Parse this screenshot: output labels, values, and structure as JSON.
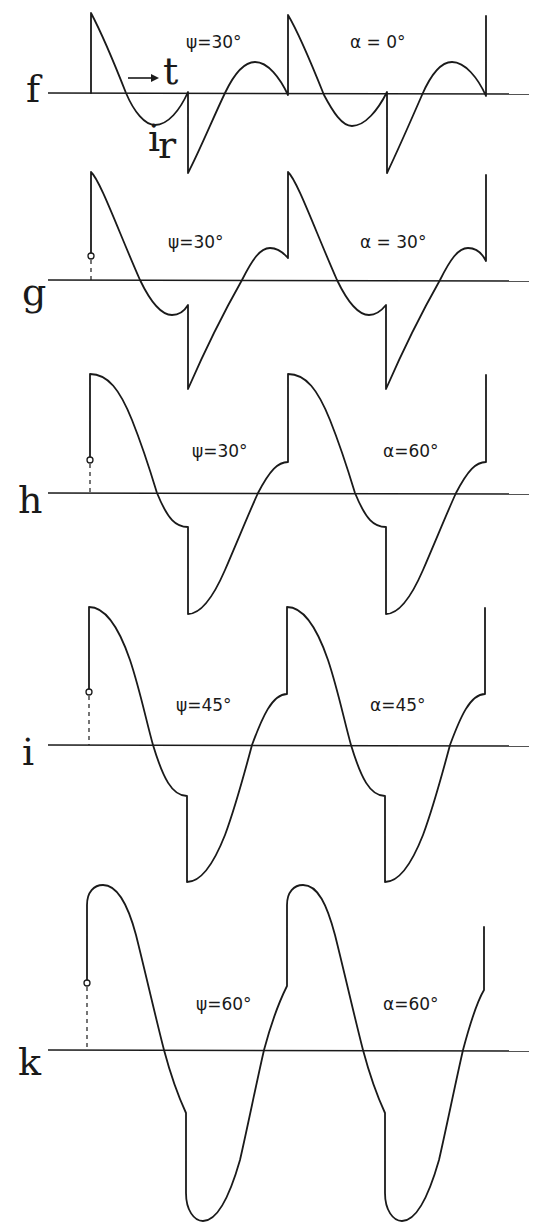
{
  "figure": {
    "ink_color": "#1a1a1a",
    "background": "#ffffff",
    "time_label": "t",
    "current_label": "i",
    "current_subscript": "r",
    "panels": [
      {
        "id": "f",
        "letter": "f",
        "psi_label": "ψ=30°",
        "alpha_label": "α = 0°",
        "axis_y": 93,
        "letter_pos": [
          26,
          102
        ],
        "psi_pos": [
          186,
          48
        ],
        "alpha_pos": [
          350,
          48
        ],
        "has_marker": false,
        "path": "M91 93 L91 13 C100 30 115 65 126 93 C134 112 145 125 155 125 C168 125 180 110 188 92 L188 173 C200 150 213 118 225 93 C235 72 245 62 255 62 C268 62 280 78 288 95 L288 15 C297 30 312 65 324 95 C333 112 342 126 352 126 C365 126 378 110 387 92 L387 173 C398 150 412 118 422 95 C432 72 442 62 452 62 C465 62 478 78 486 96 L486 16"
      },
      {
        "id": "g",
        "letter": "g",
        "psi_label": "ψ=30°",
        "alpha_label": "α = 30°",
        "axis_y": 280,
        "letter_pos": [
          22,
          305
        ],
        "psi_pos": [
          168,
          248
        ],
        "alpha_pos": [
          360,
          248
        ],
        "has_marker": true,
        "marker_y": 256,
        "path": "M91 256 L91 172 C100 180 118 230 140 280 C152 305 162 315 172 315 C180 315 185 310 188 305 L188 389 C205 350 225 310 242 280 C252 260 260 248 270 248 C280 248 285 255 288 258 L288 172 C297 180 315 230 337 280 C349 305 359 315 369 315 C377 315 382 310 386 305 L386 389 C403 350 423 310 440 280 C450 260 458 248 468 248 C478 248 483 255 486 261 L486 175"
      },
      {
        "id": "h",
        "letter": "h",
        "psi_label": "ψ=30°",
        "alpha_label": "α=60°",
        "axis_y": 493,
        "letter_pos": [
          18,
          513
        ],
        "psi_pos": [
          192,
          457
        ],
        "alpha_pos": [
          383,
          457
        ],
        "has_marker": true,
        "marker_y": 460,
        "path": "M90 460 L90 374 C108 374 120 390 132 420 C142 445 150 470 157 493 C168 520 176 527 188 527 L188 614 C200 614 212 600 225 570 C238 540 248 515 258 493 C270 470 278 462 288 462 L288 374 C306 374 318 390 330 420 C340 445 348 470 355 493 C366 520 374 527 386 527 L386 614 C398 614 410 600 423 570 C436 540 446 515 456 493 C468 470 476 462 486 462 L486 375"
      },
      {
        "id": "i",
        "letter": "i",
        "psi_label": "ψ=45°",
        "alpha_label": "α=45°",
        "axis_y": 745,
        "letter_pos": [
          22,
          765
        ],
        "psi_pos": [
          176,
          711
        ],
        "alpha_pos": [
          370,
          711
        ],
        "has_marker": true,
        "marker_y": 692,
        "path": "M89 692 L89 607 C105 607 118 625 130 660 C140 690 146 720 153 745 C163 778 172 796 187 796 L187 882 C200 882 212 868 225 835 C235 808 244 775 252 745 C262 718 272 694 287 694 L287 607 C303 607 316 625 328 660 C338 690 344 720 351 745 C361 778 370 796 385 796 L385 882 C398 882 410 868 423 835 C433 808 442 775 450 745 C460 718 470 694 485 694 L485 608"
      },
      {
        "id": "k",
        "letter": "k",
        "psi_label": "ψ=60°",
        "alpha_label": "α=60°",
        "axis_y": 1050,
        "letter_pos": [
          18,
          1075
        ],
        "psi_pos": [
          196,
          1010
        ],
        "alpha_pos": [
          383,
          1010
        ],
        "has_marker": true,
        "marker_y": 983,
        "path": "M87 983 L87 905 C87 892 94 885 103 885 C118 885 128 905 136 935 C146 975 155 1015 164 1050 C172 1080 180 1100 186 1113 L186 1193 C186 1210 194 1221 203 1221 C218 1221 230 1195 240 1160 C248 1125 256 1085 264 1050 C272 1020 280 1000 287 986 L287 905 C287 892 294 885 303 885 C318 885 327 905 335 935 C345 975 354 1015 363 1050 C371 1080 379 1100 385 1113 L385 1193 C385 1210 393 1221 402 1221 C417 1221 429 1195 439 1160 C447 1125 455 1085 463 1050 C471 1020 478 1000 484 990 L484 927"
      }
    ],
    "axis_x_start": 48,
    "axis_x_end": 529
  }
}
